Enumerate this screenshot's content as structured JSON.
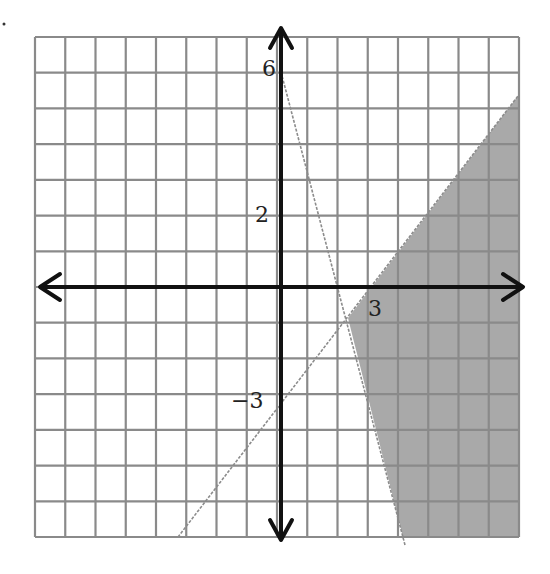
{
  "chart_data": {
    "type": "inequality-graph",
    "title": "",
    "grid": {
      "x_range": [
        -8,
        8
      ],
      "y_range": [
        -7,
        7
      ],
      "on": true
    },
    "axes": {
      "x_label": "",
      "y_label": "",
      "arrows": true
    },
    "tick_labels": [
      {
        "text": "6",
        "axis": "y",
        "value": 6
      },
      {
        "text": "2",
        "axis": "y",
        "value": 2
      },
      {
        "text": "−3",
        "axis": "y",
        "value": -3
      },
      {
        "text": "3",
        "axis": "x",
        "value": 3
      }
    ],
    "boundary_lines": [
      {
        "name": "line-1",
        "equation": "y = x - 3",
        "style": "dashed",
        "points": [
          [
            3,
            0
          ],
          [
            0,
            -3
          ]
        ]
      },
      {
        "name": "line-2",
        "equation": "y = -3x + 6",
        "style": "dashed",
        "points": [
          [
            0,
            6
          ],
          [
            2,
            0
          ]
        ]
      }
    ],
    "shaded_region": {
      "description": "below y = x - 3 and right of y = -3x + 6",
      "color": "#a9a9a9"
    }
  },
  "labels": {
    "y6": "6",
    "y2": "2",
    "yneg3": "−3",
    "x3": "3"
  },
  "colors": {
    "grid": "#8a8a8a",
    "axis": "#111111",
    "shade": "#a9a9a9",
    "boundary": "#8c8c8c"
  }
}
